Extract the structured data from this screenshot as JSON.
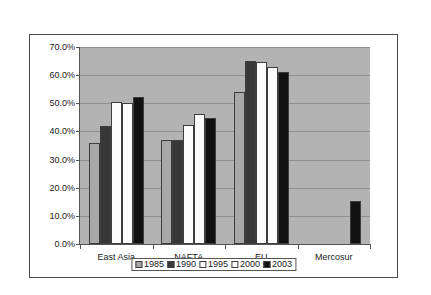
{
  "chart_data": {
    "type": "bar",
    "title": "",
    "xlabel": "",
    "ylabel": "",
    "ylim": [
      0,
      70
    ],
    "ytick_values": [
      0,
      10,
      20,
      30,
      40,
      50,
      60,
      70
    ],
    "ytick_labels": [
      "0.0%",
      "10.0%",
      "20.0%",
      "30.0%",
      "40.0%",
      "50.0%",
      "60.0%",
      "70.0%"
    ],
    "grid": true,
    "legend_position": "bottom-center",
    "categories": [
      "East Asia",
      "NAFTA",
      "EU",
      "Mercosur"
    ],
    "series": [
      {
        "name": "1985",
        "color": "#a8a8a8",
        "values": [
          36.0,
          36.8,
          54.0,
          null
        ]
      },
      {
        "name": "1990",
        "color": "#383838",
        "values": [
          41.8,
          37.0,
          65.0,
          null
        ]
      },
      {
        "name": "1995",
        "color": "#fbfbfb",
        "values": [
          50.3,
          42.2,
          64.5,
          null
        ]
      },
      {
        "name": "2000",
        "color": "#fbfbfb",
        "values": [
          50.0,
          46.3,
          63.0,
          null
        ]
      },
      {
        "name": "2003",
        "color": "#111111",
        "values": [
          52.2,
          44.6,
          61.0,
          15.2
        ]
      }
    ]
  }
}
